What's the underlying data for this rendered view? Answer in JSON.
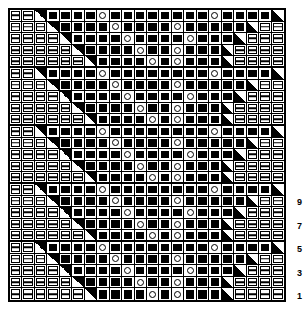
{
  "chart_data": {
    "type": "table",
    "columns": 22,
    "rows": 25,
    "repeat_rows": 5,
    "repeat_count": 5,
    "legend": [
      {
        "key": "p",
        "name": "purl-stitch",
        "glyph": "bar-in-box"
      },
      {
        "key": "k",
        "name": "knit-stitch",
        "glyph": "filled-square"
      },
      {
        "key": "o",
        "name": "yarn-over",
        "glyph": "open-circle"
      },
      {
        "key": "L",
        "name": "decrease-left-leaning",
        "glyph": "half-triangle-lower-left"
      },
      {
        "key": "R",
        "name": "decrease-right-leaning",
        "glyph": "half-triangle-upper-right"
      },
      {
        "key": "b",
        "name": "blank-no-stitch",
        "glyph": "empty"
      }
    ],
    "row_number_labels": [
      "9",
      "7",
      "5",
      "3",
      "1"
    ],
    "row_number_positions": [
      9,
      7,
      5,
      3,
      1
    ],
    "grid": [
      "ppRkkkkokkkkkkkkokkkkL",
      "pppRkkkkokkkkokkkkkLpp",
      "ppppRkkkkokkkkokkkLppp",
      "pppppRkkkkokkokkkLpppp",
      "ppppppRkkkkokokkkLppppp",
      "ppRkkkkokkkkkkkkokkkkL",
      "pppRkkkkokkkkokkkkkLpp",
      "ppppRkkkkokkkkokkkLppp",
      "pppppRkkkkokkokkkLpppp",
      "ppppppRkkkkokokkkLppppp",
      "ppRkkkkokkkkkkkkokkkkL",
      "pppRkkkkokkkkokkkkkLpp",
      "ppppRkkkkokkkkokkkLppp",
      "pppppRkkkkokkokkkLpppp",
      "ppppppRkkkkokokkkLppppp",
      "ppRkkkkokkkkkkkkokkkkL",
      "pppRkkkkokkkkokkkkkLpp",
      "ppppRkkkkokkkkokkkLppp",
      "pppppRkkkkokkokkkLpppp",
      "ppppppRkkkkokokkkLppppp",
      "ppRkkkkokkkkkkkkokkkkL",
      "pppRkkkkokkkkokkkkkLpp",
      "ppppRkkkkokkkkokkkLppp",
      "pppppRkkkkokkokkkLpppp",
      "ppppppRkkkkokokkkLppppp"
    ]
  }
}
